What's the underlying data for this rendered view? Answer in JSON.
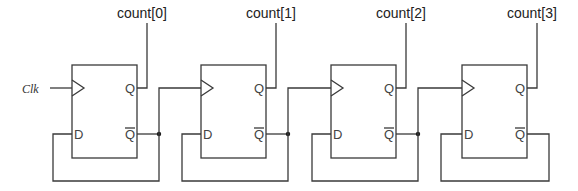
{
  "diagram": {
    "type": "ripple-counter",
    "clock_label": "Clk",
    "flip_flops": [
      {
        "id": "ff0",
        "output_label": "count[0]",
        "pin_clk": "",
        "pin_d": "D",
        "pin_q": "Q",
        "pin_qbar": "Q"
      },
      {
        "id": "ff1",
        "output_label": "count[1]",
        "pin_clk": "",
        "pin_d": "D",
        "pin_q": "Q",
        "pin_qbar": "Q"
      },
      {
        "id": "ff2",
        "output_label": "count[2]",
        "pin_clk": "",
        "pin_d": "D",
        "pin_q": "Q",
        "pin_qbar": "Q"
      },
      {
        "id": "ff3",
        "output_label": "count[3]",
        "pin_clk": "",
        "pin_d": "D",
        "pin_q": "Q",
        "pin_qbar": "Q"
      }
    ],
    "connections": [
      "Clk -> ff0.clk",
      "ff0.qbar -> ff0.d",
      "ff0.qbar -> ff1.clk",
      "ff1.qbar -> ff1.d",
      "ff1.qbar -> ff2.clk",
      "ff2.qbar -> ff2.d",
      "ff2.qbar -> ff3.clk",
      "ff3.qbar -> ff3.d",
      "ff0.q -> count[0]",
      "ff1.q -> count[1]",
      "ff2.q -> count[2]",
      "ff3.q -> count[3]"
    ]
  }
}
